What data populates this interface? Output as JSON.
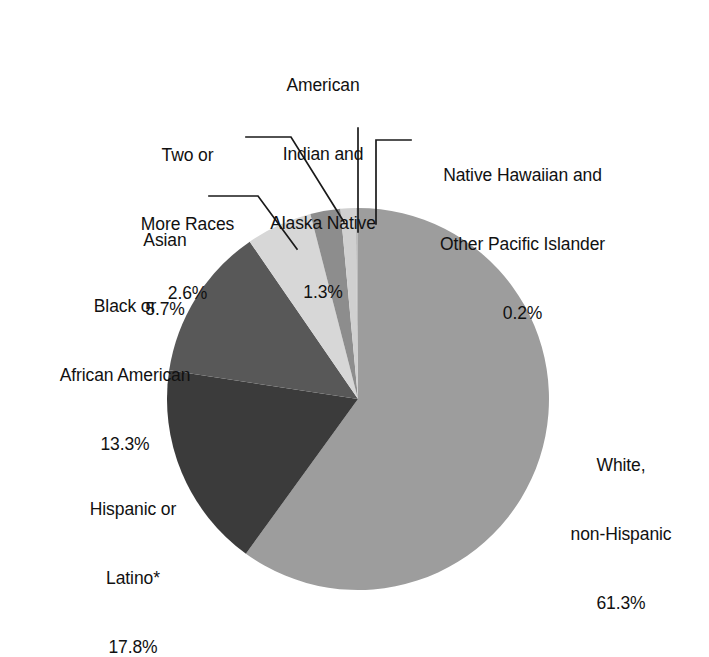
{
  "chart_data": {
    "type": "pie",
    "title": "",
    "subtitle": "",
    "xlabel": "",
    "ylabel": "",
    "legend_position": "none",
    "grid": false,
    "units": "percent",
    "start_angle_deg": 0,
    "direction": "clockwise",
    "categories": [
      "White, non-Hispanic",
      "Hispanic or Latino*",
      "Black or African American",
      "Asian",
      "Two or More Races",
      "American Indian and Alaska Native",
      "Native Hawaiian and Other Pacific Islander"
    ],
    "values": [
      61.3,
      17.8,
      13.3,
      5.7,
      2.6,
      1.3,
      0.2
    ],
    "value_labels": [
      "61.3%",
      "17.8%",
      "13.3%",
      "5.7%",
      "2.6%",
      "1.3%",
      "0.2%"
    ],
    "slice_colors": [
      "#9d9d9d",
      "#3b3b3b",
      "#585858",
      "#d7d7d7",
      "#8d8d8d",
      "#d0d0d0",
      "#bdbdbd"
    ],
    "annotations": [
      "* Hispanic or Latino may be of any race."
    ]
  },
  "labels": {
    "american_indian": {
      "line1": "American",
      "line2": "Indian and",
      "line3": "Alaska Native",
      "value": "1.3%"
    },
    "two_or_more": {
      "line1": "Two or",
      "line2": "More Races",
      "value": "2.6%"
    },
    "native_hawaiian": {
      "line1": "Native Hawaiian and",
      "line2": "Other Pacific Islander",
      "value": "0.2%"
    },
    "asian": {
      "line1": "Asian",
      "value": "5.7%"
    },
    "black": {
      "line1": "Black or",
      "line2": "African American",
      "value": "13.3%"
    },
    "hispanic": {
      "line1": "Hispanic or",
      "line2": "Latino*",
      "value": "17.8%"
    },
    "white": {
      "line1": "White,",
      "line2": "non-Hispanic",
      "value": "61.3%"
    }
  },
  "colors": {
    "background": "#ffffff",
    "text": "#111111",
    "leader_line": "#1a1a1a",
    "white_non_hispanic": "#9d9d9d",
    "hispanic": "#3b3b3b",
    "black_african_american": "#585858",
    "asian": "#d7d7d7",
    "two_or_more": "#8d8d8d",
    "american_indian": "#d0d0d0",
    "native_hawaiian": "#bdbdbd"
  }
}
